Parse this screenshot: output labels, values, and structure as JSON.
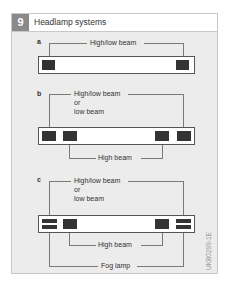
{
  "figure": {
    "number": "9",
    "title": "Headlamp systems",
    "code": "UKB0299-1E"
  },
  "diagrams": {
    "a": {
      "letter": "a",
      "top_label": "High/low beam"
    },
    "b": {
      "letter": "b",
      "top_label_line1": "High/low beam",
      "top_label_line2": "or",
      "top_label_line3": "low beam",
      "bottom_label": "High beam"
    },
    "c": {
      "letter": "c",
      "top_label_line1": "High/low beam",
      "top_label_line2": "or",
      "top_label_line3": "low beam",
      "inner_label": "High beam",
      "bottom_label": "Fog lamp"
    }
  },
  "colors": {
    "panel_bg": "#ececec",
    "number_bg": "#8a8a8a",
    "lamp": "#333333"
  }
}
